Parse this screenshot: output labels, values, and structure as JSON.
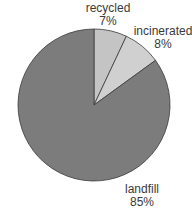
{
  "chart_data": {
    "type": "pie",
    "title": "",
    "categories": [
      "recycled",
      "incinerated",
      "landfill"
    ],
    "values": [
      7,
      8,
      85
    ],
    "labels": [
      "7%",
      "8%",
      "85%"
    ],
    "colors": [
      "#c4c4c4",
      "#d0d0d0",
      "#7c7c7c"
    ],
    "start_angle_deg": 0,
    "direction": "clockwise",
    "legend": "none",
    "label_position": "outside"
  },
  "labels": {
    "recycled": {
      "name": "recycled",
      "pct": "7%"
    },
    "incinerated": {
      "name": "incinerated",
      "pct": "8%"
    },
    "landfill": {
      "name": "landfill",
      "pct": "85%"
    }
  }
}
